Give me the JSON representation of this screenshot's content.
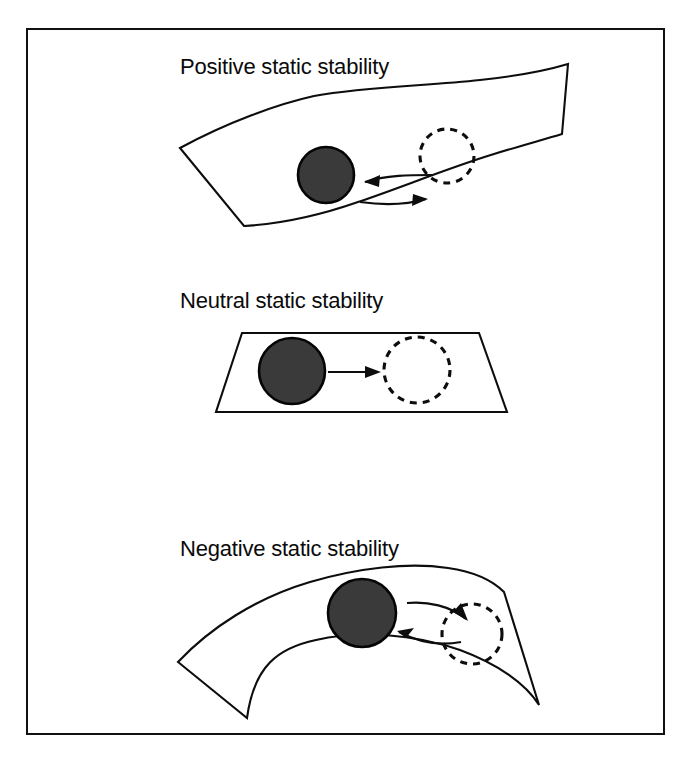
{
  "figure": {
    "title": "Static stability",
    "background_color": "#ffffff",
    "frame_color": "#111111",
    "ball_color": "#3a3a3a",
    "line_color": "#0d0d0d"
  },
  "panels": [
    {
      "id": "positive",
      "title": "Positive static stability",
      "surface_shape": "concave-up curved band (valley)",
      "ball_label": "solid ball at rest position",
      "ghost_label": "dashed ball at displaced position",
      "arrows": [
        {
          "name": "restoring-arrow",
          "direction": "left",
          "meaning": "returns toward equilibrium"
        },
        {
          "name": "displacement-arrow",
          "direction": "right",
          "meaning": "displaced from equilibrium"
        }
      ]
    },
    {
      "id": "neutral",
      "title": "Neutral static stability",
      "surface_shape": "flat plane (parallelogram)",
      "ball_label": "solid ball at original position",
      "ghost_label": "dashed ball at new position",
      "arrows": [
        {
          "name": "displacement-arrow",
          "direction": "right",
          "meaning": "remains at new position"
        }
      ]
    },
    {
      "id": "negative",
      "title": "Negative static stability",
      "surface_shape": "convex-up curved band (hill)",
      "ball_label": "solid ball at crest",
      "ghost_label": "dashed ball at displaced position",
      "arrows": [
        {
          "name": "displacement-arrow",
          "direction": "right",
          "meaning": "displaced from equilibrium"
        },
        {
          "name": "divergence-arrow",
          "direction": "left",
          "meaning": "continues away from equilibrium"
        }
      ]
    }
  ]
}
